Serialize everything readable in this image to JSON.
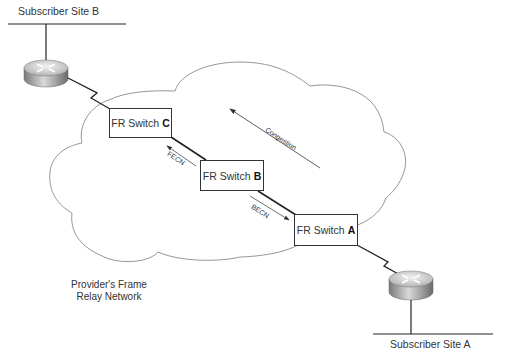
{
  "diagram": {
    "type": "frame-relay-congestion-notification",
    "sites": [
      {
        "id": "site-b",
        "label": "Subscriber Site B"
      },
      {
        "id": "site-a",
        "label": "Subscriber Site A"
      }
    ],
    "switches": [
      {
        "id": "switch-c",
        "prefix": "FR Switch",
        "letter": "C"
      },
      {
        "id": "switch-b",
        "prefix": "FR Switch",
        "letter": "B"
      },
      {
        "id": "switch-a",
        "prefix": "FR Switch",
        "letter": "A"
      }
    ],
    "arrows": {
      "congestion": "Congestion",
      "fecn": "FECN",
      "becn": "BECN"
    },
    "network_label": {
      "line1": "Provider's Frame",
      "line2": "Relay Network"
    },
    "colors": {
      "line": "#333333",
      "cloud": "#8a8a8a",
      "router_top": "#d8d8d8",
      "router_side": "#9a9a9a"
    }
  }
}
